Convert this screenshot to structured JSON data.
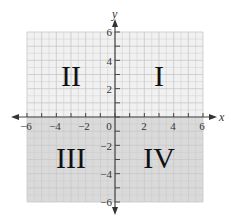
{
  "figure": {
    "x_axis": {
      "label": "x",
      "min": -6,
      "max": 6,
      "tick_labels": [
        "−6",
        "−4",
        "−2",
        "0",
        "2",
        "4",
        "6"
      ]
    },
    "y_axis": {
      "label": "y",
      "min": -6,
      "max": 6,
      "tick_labels": [
        "6",
        "4",
        "2",
        "−2",
        "−4",
        "−6"
      ]
    },
    "quadrants": [
      {
        "id": "I",
        "label": "I"
      },
      {
        "id": "II",
        "label": "II"
      },
      {
        "id": "III",
        "label": "III"
      },
      {
        "id": "IV",
        "label": "IV"
      }
    ],
    "colors": {
      "upper_fill": "#f1f1f1",
      "lower_fill": "#dadada",
      "grid_line": "#c8c8c8",
      "axis": "#444444"
    }
  }
}
